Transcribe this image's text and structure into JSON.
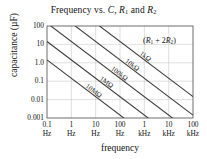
{
  "figure": {
    "title_plain": "Frequency vs. C, R1 and R2",
    "title_parts": {
      "lead": "Frequency vs. ",
      "c": "C",
      "comma": ", ",
      "r": "R",
      "one": "1",
      "and": " and ",
      "r2": "R",
      "two": "2"
    },
    "annotation": "(R1 + 2R2)",
    "annotation_parts": {
      "open": "(",
      "r_a": "R",
      "sub_a": "1",
      "plus": " + 2",
      "r_b": "R",
      "sub_b": "2",
      "close": ")"
    },
    "background": "#ffffff",
    "line_color": "#3b3b3b",
    "grid_color": "#c9c9c9",
    "axis_color": "#4a4a4a"
  },
  "chart_data": {
    "type": "line",
    "title": "Frequency vs. C, R1 and R2",
    "xlabel": "frequency",
    "ylabel": "capacitance (µF)",
    "xscale": "log",
    "yscale": "log",
    "grid": true,
    "legend": "inline-labels-on-lines",
    "xlim": [
      0.1,
      100000
    ],
    "ylim": [
      0.001,
      100
    ],
    "xticks": [
      {
        "value": 0.1,
        "num": "0.1",
        "unit": "Hz"
      },
      {
        "value": 1,
        "num": "1",
        "unit": "Hz"
      },
      {
        "value": 10,
        "num": "10",
        "unit": "Hz"
      },
      {
        "value": 100,
        "num": "100",
        "unit": "Hz"
      },
      {
        "value": 1000,
        "num": "1",
        "unit": "kHz"
      },
      {
        "value": 10000,
        "num": "10",
        "unit": "kHz"
      },
      {
        "value": 100000,
        "num": "100",
        "unit": "kHz"
      }
    ],
    "yticks": [
      {
        "value": 100,
        "label": "100"
      },
      {
        "value": 10,
        "label": "10"
      },
      {
        "value": 1,
        "label": "1.0"
      },
      {
        "value": 0.1,
        "label": "0.1"
      },
      {
        "value": 0.01,
        "label": "0.01"
      },
      {
        "value": 0.001,
        "label": "0.001"
      }
    ],
    "series": [
      {
        "name": "1kΩ",
        "label": "1kΩ",
        "resistance_ohms": 1000,
        "points": [
          {
            "x": 0.1,
            "y": 14400
          },
          {
            "x": 100000,
            "y": 0.0144
          }
        ]
      },
      {
        "name": "10kΩ",
        "label": "10kΩ",
        "resistance_ohms": 10000,
        "points": [
          {
            "x": 0.1,
            "y": 1440
          },
          {
            "x": 100000,
            "y": 0.00144
          }
        ]
      },
      {
        "name": "100kΩ",
        "label": "100kΩ",
        "resistance_ohms": 100000,
        "points": [
          {
            "x": 0.1,
            "y": 144
          },
          {
            "x": 100000,
            "y": 0.000144
          }
        ]
      },
      {
        "name": "1MΩ",
        "label": "1MΩ",
        "resistance_ohms": 1000000,
        "points": [
          {
            "x": 0.1,
            "y": 14.4
          },
          {
            "x": 100000,
            "y": 1.44e-05
          }
        ]
      },
      {
        "name": "10MΩ",
        "label": "10MΩ",
        "resistance_ohms": 10000000,
        "points": [
          {
            "x": 0.1,
            "y": 1.44
          },
          {
            "x": 100000,
            "y": 1.44e-06
          }
        ]
      }
    ],
    "annotations": [
      {
        "text": "(R1 + 2R2)",
        "x": 3000,
        "y": 30
      }
    ]
  }
}
